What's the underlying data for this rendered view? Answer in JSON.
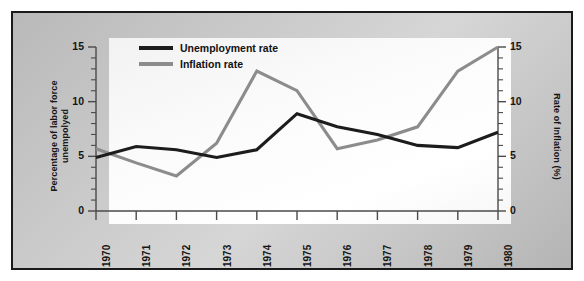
{
  "chart_data": {
    "type": "line",
    "title": "",
    "xlabel": "",
    "ylabel": "Percentage of labor force unempolyed",
    "y2label": "Rate of Inflation (%)",
    "categories": [
      "1970",
      "1971",
      "1972",
      "1973",
      "1974",
      "1975",
      "1976",
      "1977",
      "1978",
      "1979",
      "1980"
    ],
    "x": [
      1970,
      1971,
      1972,
      1973,
      1974,
      1975,
      1976,
      1977,
      1978,
      1979,
      1980
    ],
    "ylim": [
      0,
      15
    ],
    "y2lim": [
      0,
      15
    ],
    "yticks": [
      0,
      5,
      10,
      15
    ],
    "y2ticks": [
      0,
      5,
      10,
      15
    ],
    "minor_tick_step": 1,
    "grid": false,
    "legend_position": "top-left-inside",
    "series": [
      {
        "name": "Unemployment rate",
        "axis": "left",
        "color": "#1c1c1c",
        "values": [
          4.9,
          5.9,
          5.6,
          4.9,
          5.6,
          8.9,
          7.7,
          7.0,
          6.0,
          5.8,
          7.2
        ]
      },
      {
        "name": "Inflation rate",
        "axis": "right",
        "color": "#8c8c8c",
        "values": [
          5.7,
          4.4,
          3.2,
          6.2,
          12.8,
          11.0,
          5.7,
          6.5,
          7.7,
          12.8,
          15.0
        ]
      }
    ]
  },
  "axes": {
    "left_title_line1": "Percentage of labor force",
    "left_title_line2": "unempolyed",
    "right_title": "Rate of Inflation (%)",
    "left_ticks": [
      "15",
      "10",
      "5",
      "0"
    ],
    "right_ticks": [
      "15",
      "10",
      "5",
      "0"
    ],
    "x_ticks": [
      "1970",
      "1971",
      "1972",
      "1973",
      "1974",
      "1975",
      "1976",
      "1977",
      "1978",
      "1979",
      "1980"
    ]
  },
  "legend": {
    "items": [
      {
        "label": "Unemployment rate",
        "color": "#1c1c1c"
      },
      {
        "label": "Inflation rate",
        "color": "#8c8c8c"
      }
    ]
  },
  "colors": {
    "unemployment_line": "#1c1c1c",
    "inflation_line": "#8c8c8c",
    "frame_border": "#1a1a1a",
    "axis": "#4a4a4a",
    "panel_background": "#fbfbfb",
    "matte_background": "#c8c8c8"
  }
}
